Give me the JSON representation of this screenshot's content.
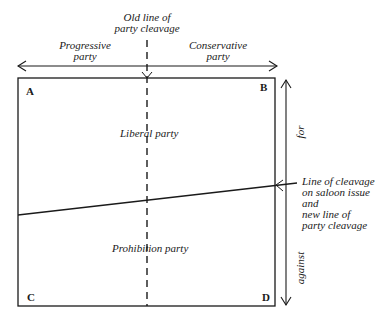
{
  "diagram": {
    "top_label": "Old line of\nparty cleavage",
    "top_label_line1": "Old line of",
    "top_label_line2": "party cleavage",
    "left_party": {
      "line1": "Progressive",
      "line2": "party"
    },
    "right_party": {
      "line1": "Conservative",
      "line2": "party"
    },
    "corners": {
      "top_left": "A",
      "top_right": "B",
      "bottom_left": "C",
      "bottom_right": "D"
    },
    "upper_region_label": "Liberal party",
    "lower_region_label": "Prohibition party",
    "vertical_axis": {
      "up_label": "for",
      "down_label": "against"
    },
    "cleavage_annotation": {
      "line1": "Line of cleavage",
      "line2": "on saloon issue",
      "line3": "and",
      "line4": "new line of",
      "line5": "party cleavage"
    },
    "colors": {
      "ink": "#1a1a1a",
      "background": "#ffffff"
    }
  }
}
